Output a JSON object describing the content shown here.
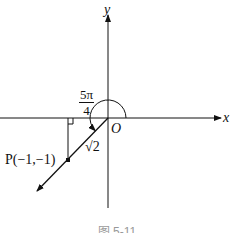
{
  "figure": {
    "axes": {
      "x_label": "x",
      "y_label": "y",
      "origin_label": "O"
    },
    "point": {
      "label": "P(−1,−1)",
      "x": -1,
      "y": -1
    },
    "angle": {
      "numerator": "5π",
      "denominator": "4"
    },
    "segment_length": "√2",
    "caption": "图 5-11"
  },
  "colors": {
    "stroke": "#111111",
    "background": "#ffffff"
  }
}
